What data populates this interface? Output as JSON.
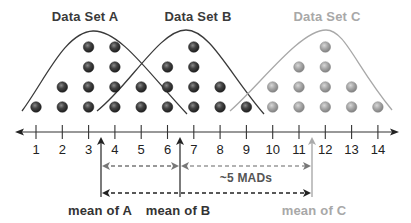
{
  "diagram": {
    "titles": {
      "a": "Data Set A",
      "b": "Data Set B",
      "c": "Data Set C"
    },
    "axis": {
      "ticks": [
        "1",
        "2",
        "3",
        "4",
        "5",
        "6",
        "7",
        "8",
        "9",
        "10",
        "11",
        "12",
        "13",
        "14"
      ]
    },
    "dot_columns": {
      "dark": [
        {
          "x": 1,
          "count": 1
        },
        {
          "x": 2,
          "count": 2
        },
        {
          "x": 3,
          "count": 4
        },
        {
          "x": 4,
          "count": 4
        },
        {
          "x": 5,
          "count": 2
        },
        {
          "x": 6,
          "count": 3
        },
        {
          "x": 7,
          "count": 4
        },
        {
          "x": 8,
          "count": 2
        },
        {
          "x": 9,
          "count": 1
        }
      ],
      "light": [
        {
          "x": 10,
          "count": 2
        },
        {
          "x": 11,
          "count": 3
        },
        {
          "x": 12,
          "count": 4
        },
        {
          "x": 13,
          "count": 2
        },
        {
          "x": 14,
          "count": 1
        }
      ]
    },
    "means": {
      "a_label": "mean of A",
      "b_label": "mean of B",
      "c_label": "mean of C",
      "a_value": 3.5,
      "b_value": 6.5,
      "c_value": 11.5
    },
    "annotation": "~5 MADs",
    "colors": {
      "dark": "#3a3a3a",
      "light": "#a0a0a0",
      "axis": "#333333"
    }
  }
}
